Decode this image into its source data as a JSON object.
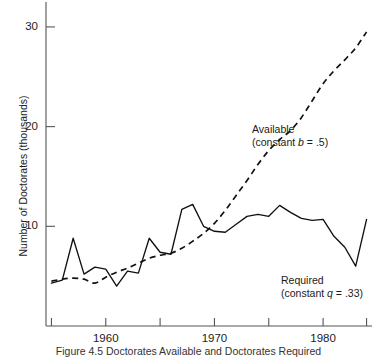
{
  "chart_data": {
    "type": "line",
    "title": "",
    "caption": "Figure 4.5   Doctorates Available and Doctorates Required",
    "xlabel": "",
    "ylabel": "Number of Doctorates (thousands)",
    "xlim": [
      1954.5,
      1984.5
    ],
    "ylim": [
      0,
      32.5
    ],
    "grid": false,
    "legend_position": "inline-annotations",
    "yticks": [
      10,
      20,
      30
    ],
    "ytick_labels": [
      "10",
      "20",
      "30"
    ],
    "xticks": [
      1955,
      1960,
      1965,
      1970,
      1975,
      1980,
      1984
    ],
    "xtick_labels": [
      "",
      "1960",
      "",
      "1970",
      "",
      "1980",
      ""
    ],
    "annotations": [
      {
        "name": "available-label",
        "line1": "Available",
        "line2_pre": "(constant ",
        "line2_var": "b",
        "line2_post": " = .5)"
      },
      {
        "name": "required-label",
        "line1": "Required",
        "line2_pre": "(constant ",
        "line2_var": "q",
        "line2_post": " = .33)"
      }
    ],
    "series": [
      {
        "name": "Required",
        "style": "solid",
        "color": "#111111",
        "x": [
          1955,
          1956,
          1957,
          1958,
          1959,
          1960,
          1961,
          1962,
          1963,
          1964,
          1965,
          1966,
          1967,
          1968,
          1969,
          1970,
          1971,
          1972,
          1973,
          1974,
          1975,
          1976,
          1977,
          1978,
          1979,
          1980,
          1981,
          1982,
          1983,
          1984
        ],
        "values": [
          4.3,
          4.6,
          8.8,
          5.2,
          5.9,
          5.7,
          4.0,
          5.5,
          5.3,
          8.8,
          7.4,
          7.2,
          11.7,
          12.2,
          10.0,
          9.5,
          9.4,
          10.2,
          11.0,
          11.2,
          11.0,
          12.1,
          11.4,
          10.8,
          10.6,
          10.7,
          9.0,
          7.9,
          6.0,
          10.7
        ]
      },
      {
        "name": "Available",
        "style": "dashed",
        "color": "#111111",
        "x": [
          1955,
          1956,
          1957,
          1958,
          1959,
          1960,
          1961,
          1962,
          1963,
          1964,
          1965,
          1966,
          1967,
          1968,
          1969,
          1970,
          1971,
          1972,
          1973,
          1974,
          1975,
          1976,
          1977,
          1978,
          1979,
          1980,
          1981,
          1982,
          1983,
          1984
        ],
        "values": [
          4.5,
          4.7,
          4.8,
          4.7,
          4.3,
          4.9,
          5.4,
          5.8,
          6.3,
          6.8,
          7.1,
          7.3,
          7.8,
          8.5,
          9.3,
          10.3,
          11.6,
          13.1,
          14.6,
          16.2,
          17.6,
          18.7,
          19.6,
          20.9,
          22.6,
          24.3,
          25.6,
          26.7,
          27.9,
          29.5
        ]
      }
    ]
  },
  "axes": {
    "y_axis_name": "y-axis",
    "x_axis_name": "x-axis"
  }
}
